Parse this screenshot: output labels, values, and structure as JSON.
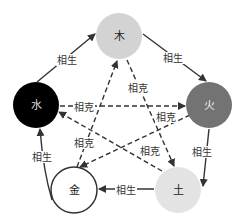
{
  "diagram": {
    "title": "",
    "nodes": [
      {
        "id": "wood",
        "label": "木",
        "cx": 119,
        "cy": 36,
        "r": 23,
        "fill": "#d3d3d3",
        "stroke": "none",
        "text_color": "#222222"
      },
      {
        "id": "fire",
        "label": "火",
        "cx": 209,
        "cy": 105,
        "r": 23,
        "fill": "#737373",
        "stroke": "none",
        "text_color": "#f0f0f0"
      },
      {
        "id": "earth",
        "label": "土",
        "cx": 178,
        "cy": 190,
        "r": 23,
        "fill": "#e3e3e3",
        "stroke": "none",
        "text_color": "#222222"
      },
      {
        "id": "metal",
        "label": "金",
        "cx": 74,
        "cy": 190,
        "r": 23,
        "fill": "#ffffff",
        "stroke": "#333333",
        "text_color": "#222222"
      },
      {
        "id": "water",
        "label": "水",
        "cx": 36,
        "cy": 105,
        "r": 23,
        "fill": "#000000",
        "stroke": "none",
        "text_color": "#dddddd"
      }
    ],
    "generating_edges": [
      {
        "from": "water",
        "to": "wood",
        "label": "相生",
        "label_x": 67,
        "label_y": 60
      },
      {
        "from": "wood",
        "to": "fire",
        "label": "相生",
        "label_x": 173,
        "label_y": 58
      },
      {
        "from": "fire",
        "to": "earth",
        "label": "相生",
        "label_x": 202,
        "label_y": 152
      },
      {
        "from": "earth",
        "to": "metal",
        "label": "相生",
        "label_x": 126,
        "label_y": 190
      },
      {
        "from": "metal",
        "to": "water",
        "label": "相生",
        "label_x": 42,
        "label_y": 157
      }
    ],
    "overcoming_edges": [
      {
        "from": "water",
        "to": "fire",
        "label": "相克",
        "label_x": 84,
        "label_y": 107
      },
      {
        "from": "wood",
        "to": "earth",
        "label": "相克",
        "label_x": 138,
        "label_y": 88
      },
      {
        "from": "fire",
        "to": "metal",
        "label": "相克",
        "label_x": 166,
        "label_y": 117
      },
      {
        "from": "metal",
        "to": "wood",
        "label": "相克",
        "label_x": 84,
        "label_y": 143
      },
      {
        "from": "earth",
        "to": "water",
        "label": "相克",
        "label_x": 150,
        "label_y": 151
      }
    ],
    "legend": {
      "solid": "相生",
      "dashed": "相克"
    },
    "colors": {
      "line": "#333333",
      "background": "#ffffff"
    }
  }
}
